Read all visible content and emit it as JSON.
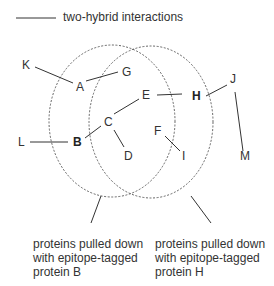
{
  "legend": {
    "line_label": "two-hybrid interactions"
  },
  "nodes": [
    {
      "id": "K",
      "label": "K",
      "x": 22,
      "y": 59,
      "bold": false
    },
    {
      "id": "A",
      "label": "A",
      "x": 76,
      "y": 81,
      "bold": false
    },
    {
      "id": "G",
      "label": "G",
      "x": 122,
      "y": 66,
      "bold": false
    },
    {
      "id": "J",
      "label": "J",
      "x": 230,
      "y": 73,
      "bold": false
    },
    {
      "id": "E",
      "label": "E",
      "x": 142,
      "y": 89,
      "bold": false
    },
    {
      "id": "H",
      "label": "H",
      "x": 192,
      "y": 90,
      "bold": true
    },
    {
      "id": "C",
      "label": "C",
      "x": 104,
      "y": 116,
      "bold": false
    },
    {
      "id": "F",
      "label": "F",
      "x": 154,
      "y": 125,
      "bold": false
    },
    {
      "id": "L",
      "label": "L",
      "x": 18,
      "y": 136,
      "bold": false
    },
    {
      "id": "B",
      "label": "B",
      "x": 73,
      "y": 136,
      "bold": true
    },
    {
      "id": "D",
      "label": "D",
      "x": 124,
      "y": 150,
      "bold": false
    },
    {
      "id": "I",
      "label": "I",
      "x": 182,
      "y": 150,
      "bold": false
    },
    {
      "id": "M",
      "label": "M",
      "x": 240,
      "y": 150,
      "bold": false
    }
  ],
  "edges": [
    [
      "K",
      "A"
    ],
    [
      "A",
      "G"
    ],
    [
      "B",
      "L"
    ],
    [
      "B",
      "C"
    ],
    [
      "C",
      "E"
    ],
    [
      "C",
      "D"
    ],
    [
      "E",
      "H"
    ],
    [
      "H",
      "J"
    ],
    [
      "J",
      "M"
    ],
    [
      "F",
      "I"
    ]
  ],
  "sets": [
    {
      "name": "set-B",
      "caption": [
        "proteins pulled down",
        "with epitope-tagged",
        "protein B"
      ]
    },
    {
      "name": "set-H",
      "caption": [
        "proteins pulled down",
        "with epitope-tagged",
        "protein H"
      ]
    }
  ],
  "colors": {
    "line": "#333333",
    "circle": "#555555",
    "text": "#333333"
  }
}
